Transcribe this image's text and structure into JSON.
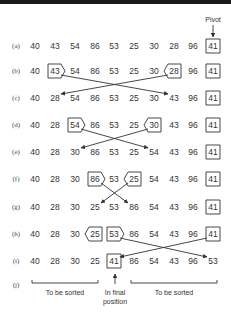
{
  "diagram": {
    "pivot_label": "Pivot",
    "columns_x": [
      35,
      55,
      75,
      95,
      114,
      134,
      154,
      174,
      193,
      213
    ],
    "label_x": 16,
    "rows": [
      {
        "label": "(a)",
        "y": 46,
        "values": [
          "40",
          "43",
          "54",
          "86",
          "53",
          "25",
          "30",
          "28",
          "96",
          "41"
        ],
        "marks": [
          {
            "col": 9,
            "shape": "box"
          }
        ],
        "swaps": []
      },
      {
        "label": "(b)",
        "y": 71,
        "values": [
          "40",
          "43",
          "54",
          "86",
          "53",
          "25",
          "30",
          "28",
          "96",
          "41"
        ],
        "marks": [
          {
            "col": 1,
            "shape": "point-right"
          },
          {
            "col": 7,
            "shape": "point-left"
          },
          {
            "col": 9,
            "shape": "box"
          }
        ],
        "swaps": [
          {
            "from": 1,
            "to": 7
          }
        ]
      },
      {
        "label": "(c)",
        "y": 98,
        "values": [
          "40",
          "28",
          "54",
          "86",
          "53",
          "25",
          "30",
          "43",
          "96",
          "41"
        ],
        "marks": [
          {
            "col": 9,
            "shape": "box"
          }
        ],
        "swaps": []
      },
      {
        "label": "(d)",
        "y": 125,
        "values": [
          "40",
          "28",
          "54",
          "86",
          "53",
          "25",
          "30",
          "43",
          "96",
          "41"
        ],
        "marks": [
          {
            "col": 2,
            "shape": "point-right"
          },
          {
            "col": 6,
            "shape": "point-left"
          },
          {
            "col": 9,
            "shape": "box"
          }
        ],
        "swaps": [
          {
            "from": 2,
            "to": 6
          }
        ]
      },
      {
        "label": "(e)",
        "y": 152,
        "values": [
          "40",
          "28",
          "30",
          "86",
          "53",
          "25",
          "54",
          "43",
          "96",
          "41"
        ],
        "marks": [
          {
            "col": 9,
            "shape": "box"
          }
        ],
        "swaps": []
      },
      {
        "label": "(f)",
        "y": 179,
        "values": [
          "40",
          "28",
          "30",
          "86",
          "53",
          "25",
          "54",
          "43",
          "96",
          "41"
        ],
        "marks": [
          {
            "col": 3,
            "shape": "point-right"
          },
          {
            "col": 5,
            "shape": "point-left"
          },
          {
            "col": 9,
            "shape": "box"
          }
        ],
        "swaps": [
          {
            "from": 3,
            "to": 5
          }
        ]
      },
      {
        "label": "(g)",
        "y": 207,
        "values": [
          "40",
          "28",
          "30",
          "25",
          "53",
          "86",
          "54",
          "43",
          "96",
          "41"
        ],
        "marks": [
          {
            "col": 9,
            "shape": "box"
          }
        ],
        "swaps": []
      },
      {
        "label": "(h)",
        "y": 234,
        "values": [
          "40",
          "28",
          "30",
          "25",
          "53",
          "86",
          "54",
          "43",
          "96",
          "41"
        ],
        "marks": [
          {
            "col": 3,
            "shape": "point-left"
          },
          {
            "col": 4,
            "shape": "point-right"
          },
          {
            "col": 9,
            "shape": "box"
          }
        ],
        "swaps": [
          {
            "from": 4,
            "to": 9
          }
        ]
      },
      {
        "label": "(i)",
        "y": 261,
        "values": [
          "40",
          "28",
          "30",
          "25",
          "41",
          "86",
          "54",
          "43",
          "96",
          "53"
        ],
        "marks": [
          {
            "col": 4,
            "shape": "box"
          }
        ],
        "swaps": []
      }
    ],
    "footer": {
      "label": "(j)",
      "y": 283,
      "left_bracket": {
        "x1": 32,
        "x2": 98,
        "text": "To be sorted"
      },
      "right_bracket": {
        "x1": 131,
        "x2": 217,
        "text": "To be sorted"
      },
      "center": {
        "x": 115,
        "line1": "In final",
        "line2": "position"
      }
    },
    "colors": {
      "ink": "#333333",
      "background": "#ffffff",
      "top_bar": "#1a1a1a"
    }
  }
}
